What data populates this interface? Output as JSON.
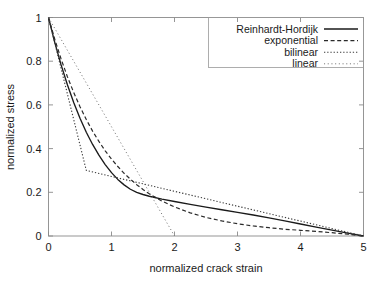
{
  "chart_data": {
    "type": "line",
    "title": "",
    "xlabel": "normalized crack strain",
    "ylabel": "normalized stress",
    "xlim": [
      0,
      5
    ],
    "ylim": [
      0,
      1
    ],
    "xticks": [
      "0",
      "1",
      "2",
      "3",
      "4",
      "5"
    ],
    "yticks": [
      "0",
      "0.2",
      "0.4",
      "0.6",
      "0.8",
      "1"
    ],
    "xtick_values": [
      0,
      1,
      2,
      3,
      4,
      5
    ],
    "ytick_values": [
      0,
      0.2,
      0.4,
      0.6,
      0.8,
      1
    ],
    "grid": false,
    "legend_position": "top-right",
    "series": [
      {
        "name": "Reinhardt-Hordijk",
        "style": "solid",
        "color": "#1a1a1a",
        "x": [
          0,
          0.1,
          0.2,
          0.3,
          0.4,
          0.5,
          0.6,
          0.7,
          0.8,
          0.9,
          1.0,
          1.1,
          1.2,
          1.3,
          1.4,
          1.5,
          1.6,
          1.8,
          2.0,
          2.25,
          2.5,
          2.75,
          3.0,
          3.25,
          3.5,
          3.75,
          4.0,
          4.25,
          4.5,
          4.75,
          5.0
        ],
        "y": [
          1.0,
          0.885,
          0.783,
          0.692,
          0.611,
          0.539,
          0.475,
          0.419,
          0.37,
          0.327,
          0.29,
          0.259,
          0.234,
          0.214,
          0.2,
          0.19,
          0.182,
          0.169,
          0.158,
          0.145,
          0.132,
          0.12,
          0.108,
          0.096,
          0.083,
          0.069,
          0.055,
          0.041,
          0.027,
          0.013,
          0.0
        ]
      },
      {
        "name": "exponential",
        "style": "dashed",
        "color": "#2a2a2a",
        "x": [
          0,
          0.1,
          0.2,
          0.3,
          0.4,
          0.5,
          0.6,
          0.7,
          0.8,
          0.9,
          1.0,
          1.1,
          1.2,
          1.3,
          1.4,
          1.5,
          1.6,
          1.8,
          2.0,
          2.25,
          2.5,
          2.75,
          3.0,
          3.25,
          3.5,
          3.75,
          4.0,
          4.25,
          4.5,
          4.75,
          5.0
        ],
        "y": [
          1.0,
          0.9,
          0.81,
          0.729,
          0.657,
          0.592,
          0.533,
          0.48,
          0.433,
          0.39,
          0.352,
          0.318,
          0.287,
          0.26,
          0.235,
          0.213,
          0.193,
          0.16,
          0.133,
          0.106,
          0.085,
          0.069,
          0.056,
          0.046,
          0.038,
          0.031,
          0.026,
          0.021,
          0.015,
          0.008,
          0.0
        ]
      },
      {
        "name": "bilinear",
        "style": "dotted",
        "color": "#3a3a3a",
        "x": [
          0,
          0.6,
          5.0
        ],
        "y": [
          1.0,
          0.3,
          0.0
        ]
      },
      {
        "name": "linear",
        "style": "dashdot",
        "color": "#7a7a7a",
        "x": [
          0,
          2.0
        ],
        "y": [
          1.0,
          0.0
        ]
      }
    ]
  },
  "legend": {
    "items": [
      {
        "label": "Reinhardt-Hordijk"
      },
      {
        "label": "exponential"
      },
      {
        "label": "bilinear"
      },
      {
        "label": "linear"
      }
    ]
  },
  "axes": {
    "x_title": "normalized crack strain",
    "y_title": "normalized stress"
  }
}
